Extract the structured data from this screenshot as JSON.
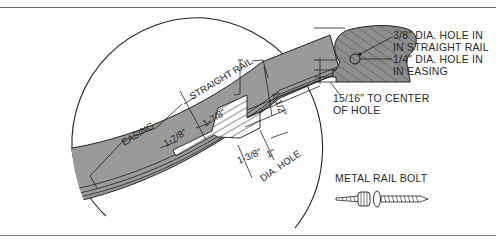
{
  "figure": {
    "main_detail": {
      "labels": {
        "easing": "EASING",
        "straight_rail": "STRAIGHT RAIL",
        "dim_a": "1-7/8\"",
        "dim_b": "1-7/8\"",
        "dim_c": "1-1/2\"",
        "dim_d": "1-3/8\"",
        "dim_e": "1\"",
        "dia_hole": "DIA. HOLE"
      }
    },
    "cross_section": {
      "callout_1_line1": "3/8\" DIA. HOLE IN",
      "callout_1_line2": "IN STRAIGHT RAIL",
      "callout_2_line1": "1/4\" DIA. HOLE IN",
      "callout_2_line2": "IN EASING",
      "callout_3_line1": "15/16\" TO CENTER",
      "callout_3_line2": "OF HOLE"
    },
    "bolt": {
      "label": "METAL RAIL BOLT"
    },
    "colors": {
      "rail_fill": "#9a9a9a",
      "line": "#1e1e1e",
      "frame": "#6b6b6b"
    }
  }
}
